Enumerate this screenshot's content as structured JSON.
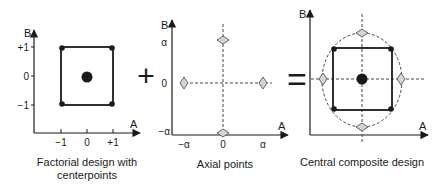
{
  "panels": [
    {
      "id": "factorial",
      "caption_line1": "Factorial design with",
      "caption_line2": "centerpoints",
      "x_axis_label": "A",
      "y_axis_label": "B",
      "x_ticks": [
        "−1",
        "0",
        "+1"
      ],
      "y_ticks": [
        "+1",
        "0",
        "−1"
      ]
    },
    {
      "id": "axial",
      "caption": "Axial points",
      "x_axis_label": "A",
      "y_axis_label": "B",
      "x_ticks": [
        "−α",
        "0",
        "α"
      ],
      "y_ticks": [
        "α",
        "0",
        "−α"
      ]
    },
    {
      "id": "central-composite",
      "caption": "Central composite design",
      "x_axis_label": "A",
      "y_axis_label": "B"
    }
  ],
  "operators": {
    "plus": "+",
    "equals": "="
  },
  "colors": {
    "line": "#1a1a1a",
    "dashed": "#444444",
    "diamond_fill": "#d4d4d4",
    "diamond_stroke": "#555555"
  }
}
